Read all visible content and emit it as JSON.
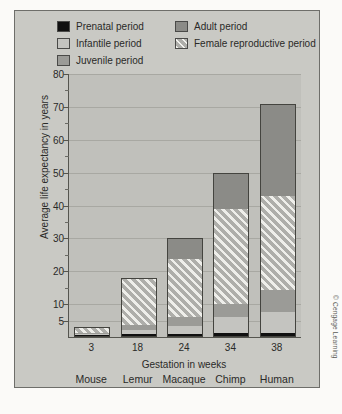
{
  "credit": "© Cengage Learning",
  "legend": {
    "left": [
      {
        "key": "prenatal",
        "label": "Prenatal period",
        "color": "#101010"
      },
      {
        "key": "infantile",
        "label": "Infantile period",
        "color": "#c4c4c0"
      },
      {
        "key": "juvenile",
        "label": "Juvenile period",
        "color": "#9b9b97"
      }
    ],
    "right": [
      {
        "key": "adult",
        "label": "Adult period",
        "color": "#8b8b87"
      },
      {
        "key": "repro",
        "label": "Female reproductive period",
        "color": "#aeaeaa"
      }
    ]
  },
  "chart_data": {
    "type": "bar",
    "stacked": true,
    "title": "",
    "xlabel": "Gestation in weeks",
    "ylabel": "Average life expectancy in years",
    "ylim": [
      0,
      80
    ],
    "yticks": [
      5,
      10,
      20,
      30,
      40,
      50,
      60,
      70,
      80
    ],
    "ytick_labels": [
      "5",
      "10",
      "20",
      "30",
      "40",
      "50",
      "60",
      "70",
      "80"
    ],
    "yminor": [
      15,
      25,
      35,
      45,
      55,
      65,
      75
    ],
    "grid": true,
    "legend_position": "top",
    "categories": [
      "Mouse",
      "Lemur",
      "Macaque",
      "Chimp",
      "Human"
    ],
    "x": [
      "3",
      "18",
      "24",
      "34",
      "38"
    ],
    "x_tick_labels_secondary": [
      "Mouse",
      "Lemur",
      "Macaque",
      "Chimp",
      "Human"
    ],
    "totals": [
      3,
      18,
      30,
      50,
      71
    ],
    "series": [
      {
        "name": "Prenatal period",
        "key": "prenatal",
        "values": [
          0.3,
          0.5,
          0.6,
          0.8,
          0.9
        ]
      },
      {
        "name": "Infantile period",
        "key": "infantile",
        "values": [
          0.4,
          1.5,
          2.4,
          5.2,
          6.5
        ]
      },
      {
        "name": "Juvenile period",
        "key": "juvenile",
        "values": [
          0.3,
          1.5,
          3.0,
          4.0,
          6.6
        ]
      },
      {
        "name": "Female reproductive period",
        "key": "repro",
        "values": [
          2.0,
          14.5,
          18.0,
          29.0,
          29.0
        ]
      },
      {
        "name": "Adult period",
        "key": "adult",
        "values": [
          0,
          0,
          6.0,
          11.0,
          28.0
        ]
      }
    ]
  }
}
